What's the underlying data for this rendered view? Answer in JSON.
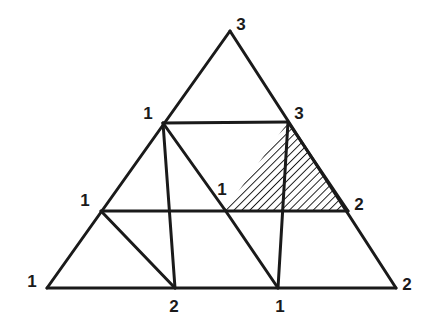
{
  "figure": {
    "name": "sperner-triangulation",
    "background_color": "#ffffff",
    "line_color": "#1a1a1a",
    "line_width": 3,
    "label_color": "#1a1a1a",
    "shaded_triangle": {
      "label": "shaded-cell-123",
      "hatch_color": "#1a1a1a",
      "hatch_angle_deg": 45,
      "hatch_spacing": 4,
      "vertex_labels": [
        "1",
        "3",
        "2"
      ]
    }
  },
  "geometry": {
    "apex": {
      "x": 230,
      "y": 31
    },
    "bottom_left": {
      "x": 47,
      "y": 288
    },
    "bottom_right": {
      "x": 396,
      "y": 288
    },
    "nodes": [
      {
        "id": "r0c0",
        "x": 230,
        "y": 31
      },
      {
        "id": "r1c0",
        "x": 163,
        "y": 123
      },
      {
        "id": "r1c1",
        "x": 288,
        "y": 122
      },
      {
        "id": "r2c0",
        "x": 101,
        "y": 211
      },
      {
        "id": "r2c1",
        "x": 225,
        "y": 210
      },
      {
        "id": "r2c2",
        "x": 348,
        "y": 211
      },
      {
        "id": "r3c0",
        "x": 47,
        "y": 288
      },
      {
        "id": "r3c1",
        "x": 175,
        "y": 288
      },
      {
        "id": "r3c2",
        "x": 278,
        "y": 288
      },
      {
        "id": "r3c3",
        "x": 396,
        "y": 288
      }
    ],
    "edges": [
      {
        "from": "r0c0",
        "to": "r3c0"
      },
      {
        "from": "r0c0",
        "to": "r3c3"
      },
      {
        "from": "r3c0",
        "to": "r3c3"
      },
      {
        "from": "r1c0",
        "to": "r1c1"
      },
      {
        "from": "r2c0",
        "to": "r2c2"
      },
      {
        "from": "r1c0",
        "to": "r3c1"
      },
      {
        "from": "r1c1",
        "to": "r3c2"
      },
      {
        "from": "r2c0",
        "to": "r3c1"
      },
      {
        "from": "r2c1",
        "to": "r3c2"
      },
      {
        "from": "r2c1",
        "to": "r1c0"
      },
      {
        "from": "r2c2",
        "to": "r1c1"
      }
    ]
  },
  "labels": [
    {
      "id": "apex",
      "text": "3",
      "x": 241,
      "y": 24
    },
    {
      "id": "upper-left",
      "text": "1",
      "x": 148,
      "y": 113
    },
    {
      "id": "upper-right",
      "text": "3",
      "x": 299,
      "y": 113
    },
    {
      "id": "mid-left",
      "text": "1",
      "x": 85,
      "y": 200
    },
    {
      "id": "mid-center",
      "text": "1",
      "x": 222,
      "y": 189
    },
    {
      "id": "mid-right",
      "text": "2",
      "x": 359,
      "y": 204
    },
    {
      "id": "bottom-left-corner",
      "text": "1",
      "x": 32,
      "y": 281
    },
    {
      "id": "bottom-mid-left",
      "text": "2",
      "x": 174,
      "y": 306
    },
    {
      "id": "bottom-mid-right",
      "text": "1",
      "x": 280,
      "y": 306
    },
    {
      "id": "bottom-right-corner",
      "text": "2",
      "x": 407,
      "y": 284
    }
  ]
}
